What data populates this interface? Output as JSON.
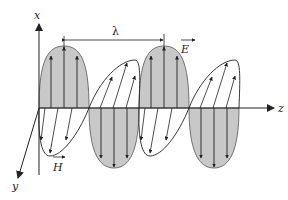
{
  "diagram": {
    "labels": {
      "x_axis": "x",
      "y_axis": "y",
      "z_axis": "z",
      "wavelength": "λ",
      "electric_field": "E",
      "magnetic_field": "H"
    },
    "colors": {
      "lobe_fill": "#c8c8c8",
      "stroke": "#222222",
      "background": "#ffffff"
    }
  }
}
